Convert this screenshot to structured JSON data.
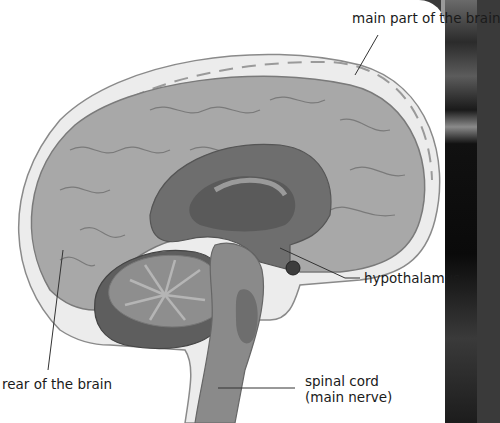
{
  "diagram": {
    "labels": {
      "main_part": "main part of the brain",
      "hypothalamus": "hypothalamus",
      "rear": "rear of the brain",
      "spinal_line1": "spinal cord",
      "spinal_line2": "(main nerve)"
    },
    "colors": {
      "background": "#ffffff",
      "skull_layer": "#ececec",
      "cerebrum": "#a8a8a8",
      "cerebrum_outline": "#7a7a7a",
      "inner_dark": "#5a5a5a",
      "cerebellum": "#8e8e8e",
      "cerebellum_dark": "#5e5e5e",
      "brainstem": "#8a8a8a",
      "leader_line": "#333333"
    }
  }
}
